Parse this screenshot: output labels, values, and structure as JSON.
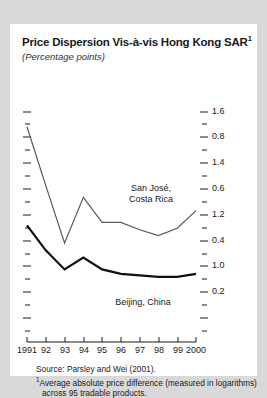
{
  "figure": {
    "title": "Price Dispersion Vis-à-vis Hong Kong SAR",
    "title_footnote_marker": "1",
    "subtitle": "(Percentage points)",
    "source_line": "Source: Parsley and Wei (2001).",
    "footnote_marker": "1",
    "footnote_text": "Average absolute price difference (measured in logarithms) across 95 tradable products."
  },
  "chart_data": {
    "type": "line",
    "title": "Price Dispersion Vis-à-vis Hong Kong SAR",
    "subtitle": "(Percentage points)",
    "xlabel": "",
    "ylabel": "",
    "x": [
      1991,
      1992,
      1993,
      1994,
      1995,
      1996,
      1997,
      1998,
      1999,
      2000
    ],
    "xtick_labels": [
      "1991",
      "92",
      "93",
      "94",
      "95",
      "96",
      "97",
      "98",
      "99",
      "2000"
    ],
    "ytick_labels": [
      "1.6",
      "1.4",
      "1.2",
      "1.0",
      "0.8",
      "0.6",
      "0.4",
      "0.2"
    ],
    "ytick_values": [
      1.6,
      1.4,
      1.2,
      1.0,
      0.8,
      0.6,
      0.4,
      0.2
    ],
    "yminor_values": [
      1.5,
      1.3,
      1.1,
      0.9,
      0.7,
      0.5,
      0.3
    ],
    "ylim": [
      0.2,
      1.7
    ],
    "xlim": [
      1991,
      2000
    ],
    "grid": false,
    "legend": "inline-labels",
    "series": [
      {
        "name": "San José,\nCosta Rica",
        "label_line1": "San José,",
        "label_line2": "Costa Rica",
        "color": "#59595b",
        "width": 1.2,
        "values": [
          1.5,
          1.1,
          0.71,
          1.02,
          0.85,
          0.85,
          0.8,
          0.76,
          0.81,
          0.93
        ]
      },
      {
        "name": "Beijing, China",
        "label_line1": "Beijing, China",
        "label_line2": "",
        "color": "#101010",
        "width": 2.2,
        "values": [
          0.83,
          0.66,
          0.53,
          0.61,
          0.53,
          0.5,
          0.49,
          0.48,
          0.48,
          0.5
        ]
      }
    ]
  }
}
